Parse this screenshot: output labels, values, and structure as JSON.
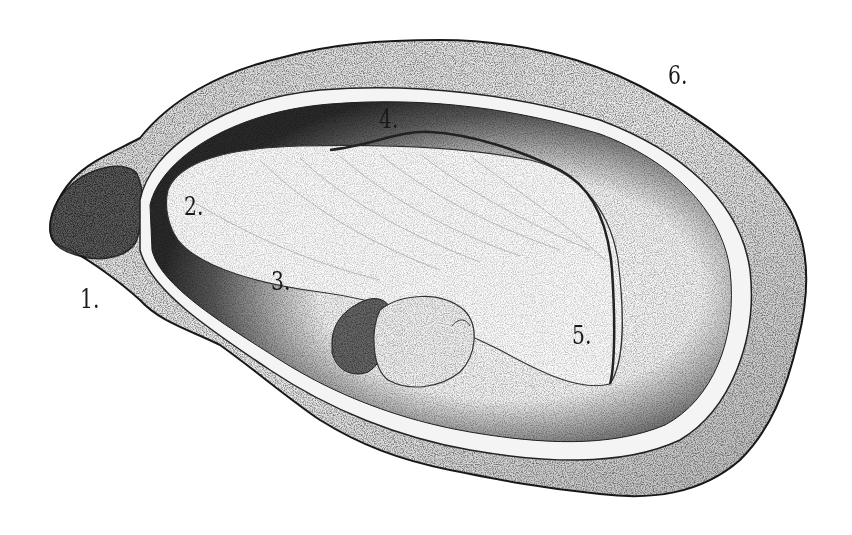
{
  "figure": {
    "style": "black and white stippled engraving",
    "colors": {
      "background": "#ffffff",
      "ink": "#1a1a1a",
      "shell_fill": "#e9e9e9",
      "mantle_dark": "#3a3a3a",
      "body_fill": "#f7f7f7"
    },
    "labels": [
      {
        "id": "1",
        "text": "1.",
        "x": 80,
        "y": 286
      },
      {
        "id": "2",
        "text": "2.",
        "x": 184,
        "y": 193
      },
      {
        "id": "3",
        "text": "3.",
        "x": 271,
        "y": 268
      },
      {
        "id": "4",
        "text": "4.",
        "x": 379,
        "y": 106
      },
      {
        "id": "5",
        "text": "5.",
        "x": 572,
        "y": 322
      },
      {
        "id": "6",
        "text": "6.",
        "x": 668,
        "y": 62
      }
    ]
  }
}
